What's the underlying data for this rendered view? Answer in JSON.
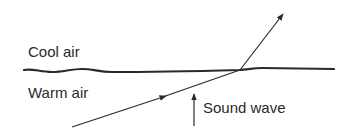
{
  "diagram": {
    "labels": {
      "upper_region": "Cool air",
      "lower_region": "Warm air",
      "wave": "Sound wave"
    },
    "colors": {
      "ink": "#2a2a2a",
      "background": "#ffffff"
    }
  }
}
